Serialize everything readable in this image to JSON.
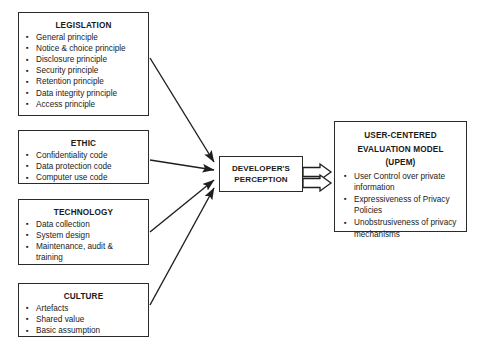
{
  "diagram": {
    "background_color": "#ffffff",
    "line_color": "#2b2b2b",
    "text_color": "#1a1a1a"
  },
  "sources": [
    {
      "id": "legislation",
      "title": "LEGISLATION",
      "items": [
        "General principle",
        "Notice & choice principle",
        "Disclosure principle",
        "Security principle",
        "Retention principle",
        "Data integrity principle",
        "Access principle"
      ]
    },
    {
      "id": "ethic",
      "title": "ETHIC",
      "items": [
        "Confidentiality code",
        "Data protection code",
        "Computer use code"
      ]
    },
    {
      "id": "technology",
      "title": "TECHNOLOGY",
      "items": [
        "Data collection",
        "System design",
        "Maintenance, audit & training"
      ]
    },
    {
      "id": "culture",
      "title": "CULTURE",
      "items": [
        "Artefacts",
        "Shared value",
        "Basic assumption"
      ]
    }
  ],
  "center": {
    "id": "developers-perception",
    "line1": "DEVELOPER'S",
    "line2": "PERCEPTION"
  },
  "outcome": {
    "id": "upem",
    "title_line1": "USER-CENTERED",
    "title_line2": "EVALUATION MODEL",
    "title_line3": "(UPEM)",
    "items": [
      "User Control over private information",
      "Expressiveness of Privacy Policies",
      "Unobstrusiveness of privacy mechanisms"
    ]
  }
}
